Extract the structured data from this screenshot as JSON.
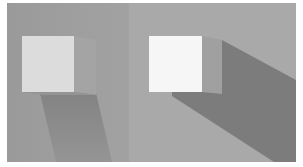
{
  "figure": {
    "panels": [
      {
        "name": "left-panel",
        "light": "soft"
      },
      {
        "name": "right-panel",
        "light": "hard"
      }
    ],
    "colors": {
      "background_left": "#9a9a9a",
      "background_right": "#a8a8a8",
      "cube_face_left": "#dcdcdc",
      "cube_face_right": "#f6f6f6",
      "cube_side": "#9c9c9c",
      "shadow_left": "#8c8c8c",
      "shadow_right": "#7a7a7a"
    }
  }
}
